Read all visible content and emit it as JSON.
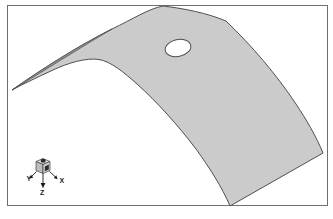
{
  "viewport": {
    "background_color": "#ffffff",
    "border_color": "#6f6f6f"
  },
  "model": {
    "surface_fill": "#cbcbcb",
    "underside_fill": "#8f8f8f",
    "edge_color": "#4f4f4f",
    "hole_fill": "#ffffff"
  },
  "triad": {
    "x_label": "X",
    "y_label": "Y",
    "z_label": "Z",
    "label_color": "#1a1a1a",
    "axis_color": "#1a1a1a",
    "cube_top_fill": "#e2e2e2",
    "cube_left_fill": "#bdbdbd",
    "cube_right_fill": "#d2d2d2",
    "cube_edge_color": "#3c3c3c",
    "cube_marker_color": "#2e2e2e"
  }
}
